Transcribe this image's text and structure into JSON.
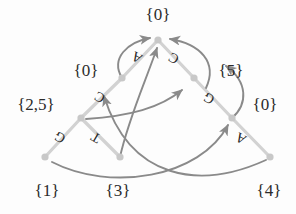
{
  "figure": {
    "canvas": {
      "width": 296,
      "height": 214
    },
    "colors": {
      "tree_edge": "#d2d2d2",
      "tree_node": "#c8c8c8",
      "suffix_link": "#8a8a8a",
      "label_text": "#2b2b2b",
      "edge_label_text": "#262626",
      "background": "#fdfdfd"
    }
  },
  "nodes": [
    {
      "id": "root",
      "label": "{0}",
      "x": 158,
      "y": 40,
      "label_x": 158,
      "label_y": 14,
      "label_size": 17
    },
    {
      "id": "n_l1",
      "label": "{0}",
      "x": 122,
      "y": 78,
      "label_x": 86,
      "label_y": 70,
      "label_size": 17
    },
    {
      "id": "n_l2",
      "label": "{2,5}",
      "x": 81,
      "y": 118,
      "label_x": 36,
      "label_y": 104,
      "label_size": 17
    },
    {
      "id": "n_l3",
      "label": "{1}",
      "x": 45,
      "y": 157,
      "label_x": 47,
      "label_y": 190,
      "label_size": 17
    },
    {
      "id": "n_m1",
      "label": "{3}",
      "x": 120,
      "y": 157,
      "label_x": 118,
      "label_y": 190,
      "label_size": 17
    },
    {
      "id": "n_r1",
      "label": "{5}",
      "x": 194,
      "y": 78,
      "label_x": 231,
      "label_y": 70,
      "label_size": 17
    },
    {
      "id": "n_r2",
      "label": "{0}",
      "x": 232,
      "y": 118,
      "label_x": 265,
      "label_y": 104,
      "label_size": 17
    },
    {
      "id": "n_r3",
      "label": "{4}",
      "x": 270,
      "y": 157,
      "label_x": 269,
      "label_y": 190,
      "label_size": 17
    }
  ],
  "tree_edges": [
    {
      "id": "e_root_l1",
      "from": "root",
      "to": "n_l1",
      "letter": "A",
      "letter_x": 137,
      "letter_y": 57,
      "rotation": -150,
      "letter_size": 14
    },
    {
      "id": "e_l1_l2",
      "from": "n_l1",
      "to": "n_l2",
      "letter": "C",
      "letter_x": 100,
      "letter_y": 97,
      "rotation": -150,
      "letter_size": 14
    },
    {
      "id": "e_l2_l3",
      "from": "n_l2",
      "to": "n_l3",
      "letter": "G",
      "letter_x": 60,
      "letter_y": 137,
      "rotation": -150,
      "letter_size": 14
    },
    {
      "id": "e_l2_m1",
      "from": "n_l2",
      "to": "n_m1",
      "letter": "T",
      "letter_x": 96,
      "letter_y": 137,
      "rotation": -150,
      "letter_size": 14
    },
    {
      "id": "e_root_r1",
      "from": "root",
      "to": "n_r1",
      "letter": "C",
      "letter_x": 174,
      "letter_y": 58,
      "rotation": -150,
      "letter_size": 14
    },
    {
      "id": "e_r1_r2",
      "from": "n_r1",
      "to": "n_r2",
      "letter": "G",
      "letter_x": 209,
      "letter_y": 98,
      "rotation": -150,
      "letter_size": 14
    },
    {
      "id": "e_r2_r3",
      "from": "n_r2",
      "to": "n_r3",
      "letter": "A",
      "letter_x": 241,
      "letter_y": 138,
      "rotation": -150,
      "letter_size": 14
    }
  ],
  "suffix_links": [
    {
      "id": "link_l1_root",
      "from": "n_l1",
      "to": "root",
      "path": "M 122 78 C 110 58 128 42 150 38",
      "description": "from-node-0-left-to-root"
    },
    {
      "id": "link_r1_root",
      "from": "n_r1",
      "to": "root",
      "path": "M 206 88 C 218 62 200 44 170 39",
      "description": "from-node-5-right-to-root"
    },
    {
      "id": "link_r2_r1",
      "from": "n_r2",
      "to": "n_r1",
      "path": "M 232 118 C 248 104 248 82 226 66",
      "description": "from-node-0-right-to-node-5"
    },
    {
      "id": "link_m1_root",
      "from": "n_m1",
      "to": "root",
      "path": "M 120 157 C 128 120 146 80 157 48",
      "description": "from-node-3-to-root"
    },
    {
      "id": "link_l2_mid",
      "from": "n_l2",
      "to": "mid",
      "path": "M 86 119 C 130 116 160 108 182 90",
      "description": "from-node-2-5-to-midpoint"
    },
    {
      "id": "link_l3_r2",
      "from": "n_l3",
      "to": "n_r2",
      "path": "M 52 162 C 110 192 200 178 228 125",
      "description": "from-node-1-to-node-0-right"
    },
    {
      "id": "link_r3_l1",
      "from": "n_r3",
      "to": "n_l1",
      "path": "M 266 160 C 200 190 130 180 104 96",
      "description": "from-node-4-to-node-0-left"
    }
  ],
  "alphabet": [
    "A",
    "C",
    "G",
    "T"
  ]
}
